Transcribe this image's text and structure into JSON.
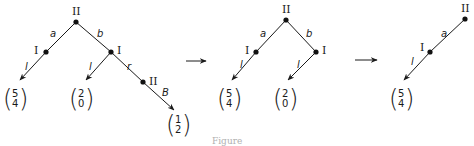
{
  "figure": {
    "caption": "Figure",
    "colors": {
      "ink": "#1a1a1a",
      "background": "#ffffff"
    },
    "trees": [
      {
        "id": "tree-1",
        "nodes": [
          {
            "id": "root",
            "player": "II"
          },
          {
            "id": "left",
            "player": "I"
          },
          {
            "id": "right",
            "player": "I"
          },
          {
            "id": "right-right",
            "player": "II"
          }
        ],
        "edges": [
          {
            "from": "root",
            "to": "left",
            "label": "a"
          },
          {
            "from": "root",
            "to": "right",
            "label": "b"
          },
          {
            "from": "left",
            "to": "leaf-1",
            "label": "l"
          },
          {
            "from": "right",
            "to": "leaf-2",
            "label": "l"
          },
          {
            "from": "right",
            "to": "right-right",
            "label": "r"
          },
          {
            "from": "right-right",
            "to": "leaf-3",
            "label": "B"
          }
        ],
        "payoffs": [
          {
            "id": "leaf-1",
            "top": "5",
            "bottom": "4"
          },
          {
            "id": "leaf-2",
            "top": "2",
            "bottom": "0"
          },
          {
            "id": "leaf-3",
            "top": "1",
            "bottom": "2"
          }
        ]
      },
      {
        "id": "tree-2",
        "nodes": [
          {
            "id": "root",
            "player": "II"
          },
          {
            "id": "left",
            "player": "I"
          },
          {
            "id": "right",
            "player": "I"
          }
        ],
        "edges": [
          {
            "from": "root",
            "to": "left",
            "label": "a"
          },
          {
            "from": "root",
            "to": "right",
            "label": "b"
          },
          {
            "from": "left",
            "to": "leaf-1",
            "label": "l"
          },
          {
            "from": "right",
            "to": "leaf-2",
            "label": "l"
          }
        ],
        "payoffs": [
          {
            "id": "leaf-1",
            "top": "5",
            "bottom": "4"
          },
          {
            "id": "leaf-2",
            "top": "2",
            "bottom": "0"
          }
        ]
      },
      {
        "id": "tree-3",
        "nodes": [
          {
            "id": "root",
            "player": "II"
          },
          {
            "id": "left",
            "player": "I"
          }
        ],
        "edges": [
          {
            "from": "root",
            "to": "left",
            "label": "a"
          },
          {
            "from": "left",
            "to": "leaf-1",
            "label": "l"
          }
        ],
        "payoffs": [
          {
            "id": "leaf-1",
            "top": "5",
            "bottom": "4"
          }
        ]
      }
    ],
    "transition_arrows": [
      "reduction-arrow",
      "reduction-arrow"
    ]
  }
}
